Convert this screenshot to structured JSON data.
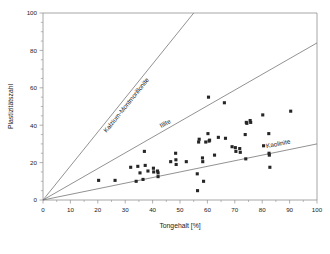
{
  "chart_data": {
    "type": "scatter",
    "title": "",
    "xlabel": "Tongehalt [%]",
    "ylabel": "Plastizitätszahl",
    "xlim": [
      0,
      100
    ],
    "ylim": [
      0,
      100
    ],
    "xticks": [
      0,
      10,
      20,
      30,
      40,
      50,
      60,
      70,
      80,
      90,
      100
    ],
    "xtick_labels": [
      "0",
      "10",
      "20",
      "30",
      "40",
      "50",
      "60",
      "70",
      "80",
      "90",
      "100"
    ],
    "yticks": [
      0,
      20,
      40,
      60,
      80,
      100
    ],
    "ytick_labels": [
      "0",
      "20",
      "40",
      "60",
      "80",
      "100"
    ],
    "y_minor_ticks": [
      10,
      30,
      50,
      70,
      90
    ],
    "grid": false,
    "legend": "none",
    "marker": "square",
    "marker_color": "#262626",
    "line_color": "#6e6e6e",
    "frame_color": "#8f8f8f",
    "reference_lines": [
      {
        "name": "Kalzium-Montmorillonite",
        "label": "Kalzium-Montmorillonite",
        "slope": 1.82,
        "x_from": 0,
        "y_from": 0,
        "x_to": 55,
        "y_to": 100,
        "label_x": 31,
        "label_y": 50
      },
      {
        "name": "Illite",
        "label": "Illite",
        "slope": 0.84,
        "x_from": 0,
        "y_from": 0,
        "x_to": 100,
        "y_to": 84,
        "label_x": 45,
        "label_y": 40
      },
      {
        "name": "Kaolinite",
        "label": "Kaolinite",
        "slope": 0.3,
        "x_from": 0,
        "y_from": 0,
        "x_to": 100,
        "y_to": 30,
        "label_x": 86,
        "label_y": 29
      }
    ],
    "points": [
      {
        "x": 20.3,
        "y": 10.5
      },
      {
        "x": 26.3,
        "y": 10.5
      },
      {
        "x": 32.0,
        "y": 17.5
      },
      {
        "x": 34.0,
        "y": 10.0
      },
      {
        "x": 34.6,
        "y": 18.0
      },
      {
        "x": 35.4,
        "y": 14.5
      },
      {
        "x": 36.5,
        "y": 11.0
      },
      {
        "x": 37.0,
        "y": 26.0
      },
      {
        "x": 37.3,
        "y": 18.5
      },
      {
        "x": 38.3,
        "y": 15.5
      },
      {
        "x": 40.3,
        "y": 17.0
      },
      {
        "x": 40.4,
        "y": 15.0
      },
      {
        "x": 41.8,
        "y": 15.5
      },
      {
        "x": 42.0,
        "y": 14.5
      },
      {
        "x": 42.0,
        "y": 12.5
      },
      {
        "x": 46.6,
        "y": 20.5
      },
      {
        "x": 48.4,
        "y": 25.0
      },
      {
        "x": 48.5,
        "y": 21.5
      },
      {
        "x": 48.6,
        "y": 19.0
      },
      {
        "x": 52.3,
        "y": 20.5
      },
      {
        "x": 56.3,
        "y": 14.0
      },
      {
        "x": 56.4,
        "y": 5.0
      },
      {
        "x": 56.8,
        "y": 31.0
      },
      {
        "x": 57.0,
        "y": 32.5
      },
      {
        "x": 58.2,
        "y": 22.5
      },
      {
        "x": 58.3,
        "y": 20.5
      },
      {
        "x": 58.6,
        "y": 10.0
      },
      {
        "x": 59.4,
        "y": 31.0
      },
      {
        "x": 60.2,
        "y": 35.5
      },
      {
        "x": 60.4,
        "y": 55.0
      },
      {
        "x": 60.6,
        "y": 31.5
      },
      {
        "x": 60.8,
        "y": 32.0
      },
      {
        "x": 62.6,
        "y": 24.0
      },
      {
        "x": 64.0,
        "y": 33.5
      },
      {
        "x": 66.2,
        "y": 52.0
      },
      {
        "x": 66.6,
        "y": 33.0
      },
      {
        "x": 69.0,
        "y": 28.5
      },
      {
        "x": 70.2,
        "y": 28.0
      },
      {
        "x": 70.4,
        "y": 26.0
      },
      {
        "x": 71.8,
        "y": 27.5
      },
      {
        "x": 72.0,
        "y": 25.5
      },
      {
        "x": 73.8,
        "y": 35.0
      },
      {
        "x": 74.0,
        "y": 22.0
      },
      {
        "x": 74.2,
        "y": 41.5
      },
      {
        "x": 74.4,
        "y": 41.0
      },
      {
        "x": 75.6,
        "y": 42.5
      },
      {
        "x": 75.8,
        "y": 41.5
      },
      {
        "x": 80.2,
        "y": 45.5
      },
      {
        "x": 80.5,
        "y": 29.0
      },
      {
        "x": 82.4,
        "y": 35.5
      },
      {
        "x": 82.5,
        "y": 25.0
      },
      {
        "x": 82.6,
        "y": 24.0
      },
      {
        "x": 82.8,
        "y": 17.5
      },
      {
        "x": 90.4,
        "y": 47.5
      }
    ]
  }
}
